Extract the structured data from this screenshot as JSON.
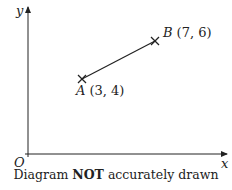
{
  "axes": {
    "x_label": "x",
    "y_label": "y",
    "origin_label": "O"
  },
  "points": [
    {
      "name": "A",
      "label": "A",
      "coords": "(3, 4)",
      "x": 3,
      "y": 4
    },
    {
      "name": "B",
      "label": "B",
      "coords": "(7, 6)",
      "x": 7,
      "y": 6
    }
  ],
  "segment": {
    "from": "A",
    "to": "B"
  },
  "caption": {
    "before": "Diagram ",
    "bold": "NOT",
    "after": " accurately drawn"
  },
  "colors": {
    "ink": "#222222",
    "background": "#ffffff"
  }
}
